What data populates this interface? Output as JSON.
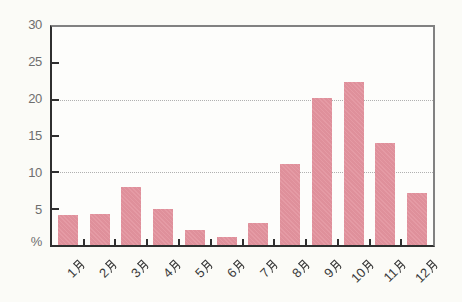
{
  "chart_data": {
    "type": "bar",
    "categories": [
      "1月",
      "2月",
      "3月",
      "4月",
      "5月",
      "6月",
      "7月",
      "8月",
      "9月",
      "10月",
      "11月",
      "12月"
    ],
    "values": [
      4.1,
      4.2,
      8.0,
      5.0,
      2.1,
      1.1,
      3.0,
      11.1,
      20.3,
      22.5,
      14.1,
      7.1
    ],
    "title": "",
    "xlabel": "",
    "ylabel": "%",
    "ylim": [
      0,
      30
    ],
    "yticks": [
      5,
      10,
      15,
      20,
      25,
      30
    ],
    "ytick_marks": [
      5,
      10,
      15,
      20,
      25
    ],
    "gridlines_at": [
      10,
      20
    ],
    "grid": "horizontal dotted lines at 10 and 20 only",
    "legend_position": "none",
    "bar_color": "#e3939e"
  },
  "colors": {
    "bar": "#e3939e",
    "axis_dark": "#2f2f2f",
    "frame_gray": "#818181",
    "grid": "#b0b0b0",
    "tick_label": "#6e6e6e",
    "x_label": "#3a3a3a",
    "background": "#fbfbf7"
  }
}
